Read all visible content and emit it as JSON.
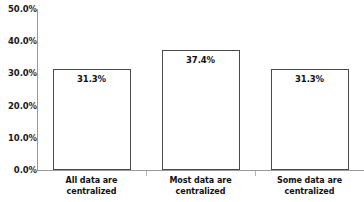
{
  "chart_data": {
    "type": "bar",
    "title": "",
    "subtitle": "",
    "xlabel": "",
    "ylabel": "",
    "categories": [
      "All data are centralized",
      "Most data are centralized",
      "Some data are centralized"
    ],
    "category_lines": [
      [
        "All data are",
        "centralized"
      ],
      [
        "Most data are",
        "centralized"
      ],
      [
        "Some data are",
        "centralized"
      ]
    ],
    "values": [
      31.3,
      37.4,
      31.3
    ],
    "value_labels": [
      "31.3%",
      "37.4%",
      "31.3%"
    ],
    "ylim": [
      0,
      50
    ],
    "ytick_values": [
      0,
      10,
      20,
      30,
      40,
      50
    ],
    "ytick_labels": [
      "0.0%",
      "10.0%",
      "20.0%",
      "30.0%",
      "40.0%",
      "50.0%"
    ],
    "grid": false,
    "legend": false,
    "legend_position": "none",
    "bar_fill_color": "#ffffff",
    "bar_border_color": "#4a4a4a",
    "axis_color": "#9a9a9a",
    "text_color": "#111111"
  }
}
